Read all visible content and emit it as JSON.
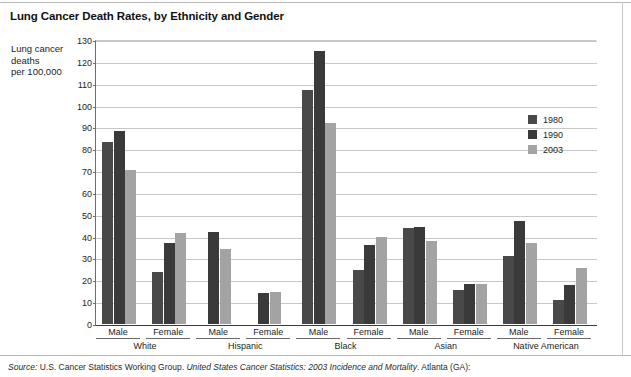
{
  "title": "Lung Cancer Death Rates, by Ethnicity and Gender",
  "axis_title_lines": [
    "Lung cancer",
    "deaths",
    "per 100,000"
  ],
  "source": {
    "label": "Source:",
    "part1": " U.S. Cancer Statistics Working Group. ",
    "italic": "United States Cancer Statistics: 2003 Incidence and Mortality",
    "part2": ". Atlanta (GA):"
  },
  "legend": {
    "position": "inside-right",
    "entries": [
      {
        "label": "1980",
        "color": "#494949"
      },
      {
        "label": "1990",
        "color": "#3a3a3a"
      },
      {
        "label": "2003",
        "color": "#a3a3a3"
      }
    ]
  },
  "chart_data": {
    "type": "bar",
    "title": "Lung Cancer Death Rates, by Ethnicity and Gender",
    "xlabel": "",
    "ylabel": "Lung cancer deaths per 100,000",
    "ylim": [
      0,
      130
    ],
    "ytick_step": 10,
    "yticks": [
      0,
      10,
      20,
      30,
      40,
      50,
      60,
      70,
      80,
      90,
      100,
      110,
      120,
      130
    ],
    "grid": true,
    "legend_position": "inside-right",
    "series_names": [
      "1980",
      "1990",
      "2003"
    ],
    "series_colors": [
      "#494949",
      "#3a3a3a",
      "#a3a3a3"
    ],
    "groups": [
      {
        "ethnicity": "White",
        "genders": [
          {
            "gender": "Male",
            "values": {
              "1980": 83.5,
              "1990": 88.5,
              "2003": 70.5
            }
          },
          {
            "gender": "Female",
            "values": {
              "1980": 24.0,
              "1990": 37.0,
              "2003": 41.5
            }
          }
        ]
      },
      {
        "ethnicity": "Hispanic",
        "genders": [
          {
            "gender": "Male",
            "values": {
              "1980": null,
              "1990": 42.0,
              "2003": 34.5
            }
          },
          {
            "gender": "Female",
            "values": {
              "1980": null,
              "1990": 14.0,
              "2003": 14.5
            }
          }
        ]
      },
      {
        "ethnicity": "Black",
        "genders": [
          {
            "gender": "Male",
            "values": {
              "1980": 107.0,
              "1990": 125.0,
              "2003": 92.0
            }
          },
          {
            "gender": "Female",
            "values": {
              "1980": 24.5,
              "1990": 36.0,
              "2003": 40.0
            }
          }
        ]
      },
      {
        "ethnicity": "Asian",
        "genders": [
          {
            "gender": "Male",
            "values": {
              "1980": 44.0,
              "1990": 44.5,
              "2003": 38.0
            }
          },
          {
            "gender": "Female",
            "values": {
              "1980": 15.5,
              "1990": 18.5,
              "2003": 18.5
            }
          }
        ]
      },
      {
        "ethnicity": "Native American",
        "genders": [
          {
            "gender": "Male",
            "values": {
              "1980": 31.0,
              "1990": 47.0,
              "2003": 37.0
            }
          },
          {
            "gender": "Female",
            "values": {
              "1980": 11.0,
              "1990": 18.0,
              "2003": 25.5
            }
          }
        ]
      }
    ]
  }
}
